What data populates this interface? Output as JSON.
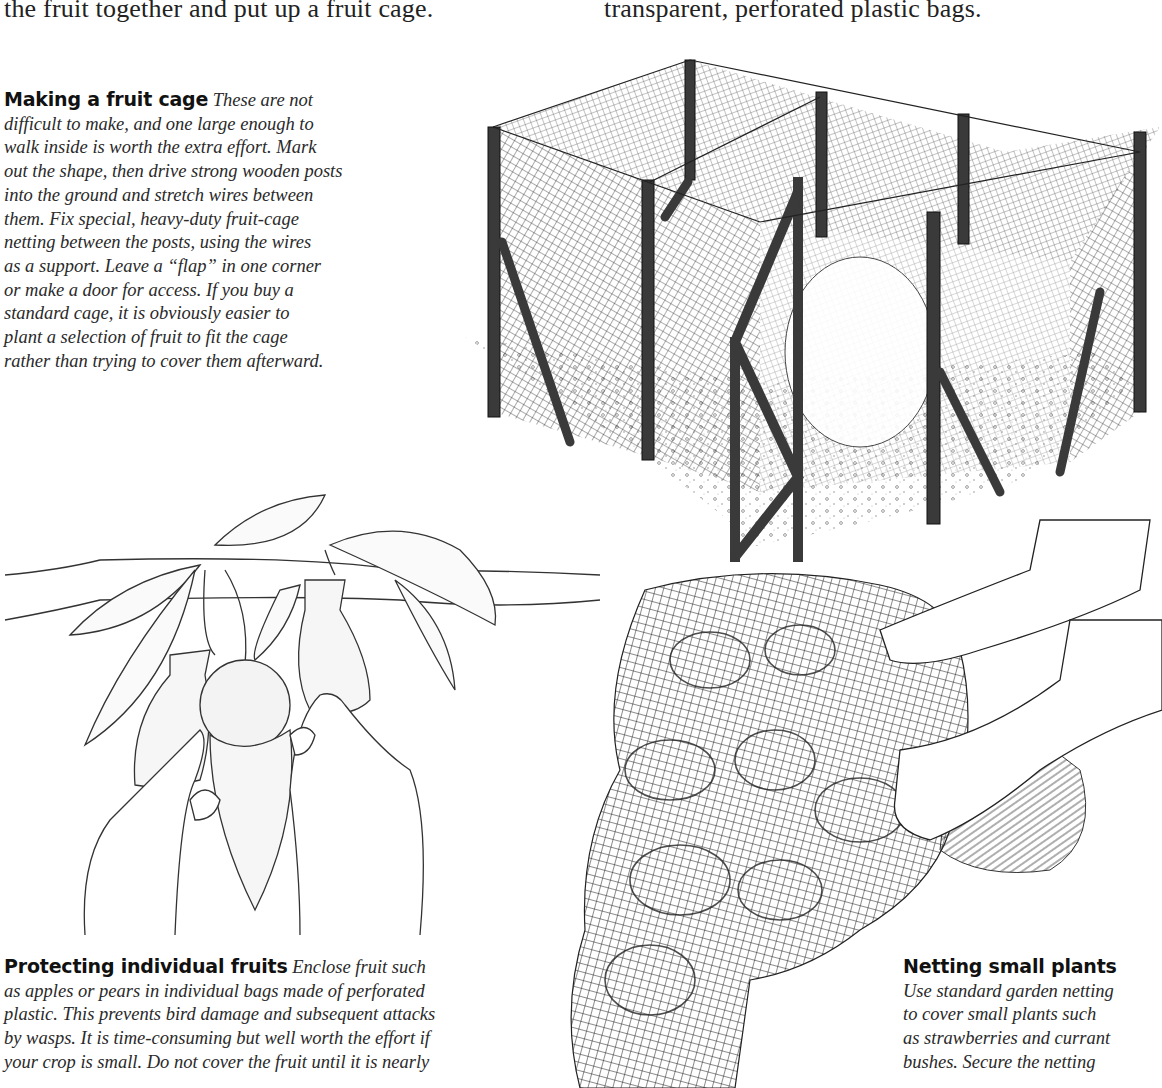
{
  "page": {
    "top_text": {
      "left_column_line": "the fruit together and put up a fruit cage.",
      "right_column_line": "transparent, perforated plastic bags."
    },
    "captions": [
      {
        "id": "fruit-cage",
        "heading": "Making a fruit cage",
        "lines": [
          "These are not",
          "difficult to make, and one large enough to",
          "walk inside is worth the extra effort. Mark",
          "out the shape, then drive strong wooden posts",
          "into the ground and stretch wires between",
          "them. Fix special, heavy-duty fruit-cage",
          "netting between the posts, using the wires",
          "as a support. Leave a “flap” in one corner",
          "or make a door for access. If you buy a",
          "standard cage, it is obviously easier to",
          "plant a selection of fruit to fit the cage",
          "rather than trying to cover them afterward."
        ]
      },
      {
        "id": "individual-fruits",
        "heading": "Protecting individual fruits",
        "lines": [
          "Enclose fruit such",
          "as apples or pears in individual bags made of perforated",
          "plastic. This prevents bird damage and subsequent attacks",
          "by wasps. It is time-consuming but well worth the effort if",
          "your crop is small. Do not cover the fruit until it is nearly"
        ]
      },
      {
        "id": "netting-plants",
        "heading": "Netting small plants",
        "lines": [
          "Use standard garden netting",
          "to cover small plants such",
          "as strawberries and currant",
          "bushes. Secure the netting"
        ]
      }
    ],
    "figures": [
      {
        "id": "fruit-cage-illustration",
        "description": "Walk-in fruit cage with wooden posts, netting and open door"
      },
      {
        "id": "bagging-fruit-illustration",
        "description": "Hands enclosing a fruit in a perforated plastic bag on a branch"
      },
      {
        "id": "netting-plants-illustration",
        "description": "Hands draping garden netting over small plants"
      }
    ],
    "colors": {
      "ink": "#1a1a1a",
      "post": "#3a3a3a",
      "paper": "#ffffff"
    }
  }
}
